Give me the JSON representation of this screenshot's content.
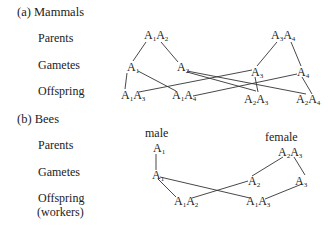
{
  "mammals": {
    "heading": "(a)  Mammals",
    "rows": {
      "parents": "Parents",
      "gametes": "Gametes",
      "offspring": "Offspring"
    },
    "parents": [
      {
        "id": "p1",
        "alleles": [
          "1",
          "2"
        ]
      },
      {
        "id": "p2",
        "alleles": [
          "3",
          "4"
        ]
      }
    ],
    "gametes": [
      {
        "id": "g1",
        "allele": "1"
      },
      {
        "id": "g2",
        "allele": "2"
      },
      {
        "id": "g3",
        "allele": "3"
      },
      {
        "id": "g4",
        "allele": "4"
      }
    ],
    "offspring": [
      {
        "id": "o1",
        "alleles": [
          "1",
          "3"
        ]
      },
      {
        "id": "o2",
        "alleles": [
          "1",
          "4"
        ]
      },
      {
        "id": "o3",
        "alleles": [
          "2",
          "3"
        ]
      },
      {
        "id": "o4",
        "alleles": [
          "2",
          "4"
        ]
      }
    ]
  },
  "bees": {
    "heading": "(b)  Bees",
    "rows": {
      "parents": "Parents",
      "gametes": "Gametes",
      "offspring": "Offspring",
      "offspring_sub": "(workers)"
    },
    "male_label": "male",
    "female_label": "female",
    "parents": [
      {
        "id": "m",
        "alleles": [
          "1"
        ]
      },
      {
        "id": "f",
        "alleles": [
          "2",
          "3"
        ]
      }
    ],
    "gametes": [
      {
        "id": "gm",
        "allele": "1"
      },
      {
        "id": "gf1",
        "allele": "2"
      },
      {
        "id": "gf2",
        "allele": "3"
      }
    ],
    "offspring": [
      {
        "id": "w1",
        "alleles": [
          "1",
          "2"
        ]
      },
      {
        "id": "w2",
        "alleles": [
          "1",
          "3"
        ]
      }
    ]
  },
  "allele_symbol": "A"
}
